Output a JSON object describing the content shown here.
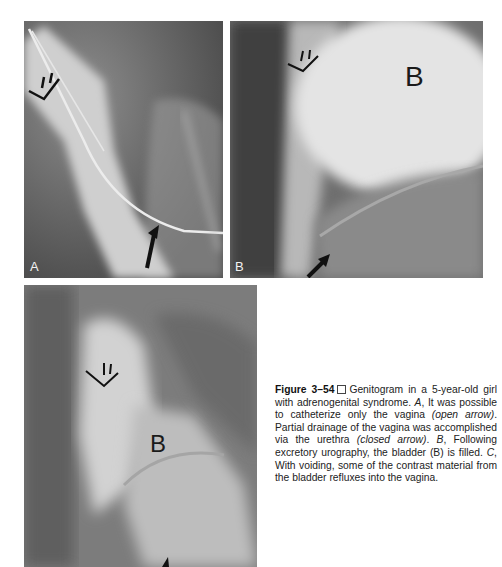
{
  "figure": {
    "number_label": "Figure 3–54",
    "separator_icon": "square-box",
    "caption_parts": {
      "intro": "Genitogram in a 5-year-old girl with adrenogenital syndrome.",
      "a_label": "A",
      "a_text_1": ", It was possible to catheterize only the vagina",
      "a_note_1": "(open arrow)",
      "a_text_2": ". Partial drainage of the vagina was accomplished via the urethra",
      "a_note_2": "(closed arrow)",
      "a_text_3": ".",
      "b_label": "B",
      "b_text": ", Following excretory urography, the bladder (B) is filled.",
      "c_label": "C",
      "c_text": ", With voiding, some of the contrast material from the bladder refluxes into the vagina."
    }
  },
  "panels": [
    {
      "id": "A",
      "corner_label": "A",
      "annotations": [
        "open-arrow",
        "closed-arrow"
      ]
    },
    {
      "id": "B",
      "corner_label": "B",
      "bladder_label": "B",
      "annotations": [
        "open-arrow",
        "closed-arrow"
      ]
    },
    {
      "id": "C",
      "bladder_label": "B",
      "annotations": [
        "open-arrow",
        "closed-arrow"
      ]
    }
  ],
  "colors": {
    "background": "#ffffff",
    "text": "#222222"
  }
}
